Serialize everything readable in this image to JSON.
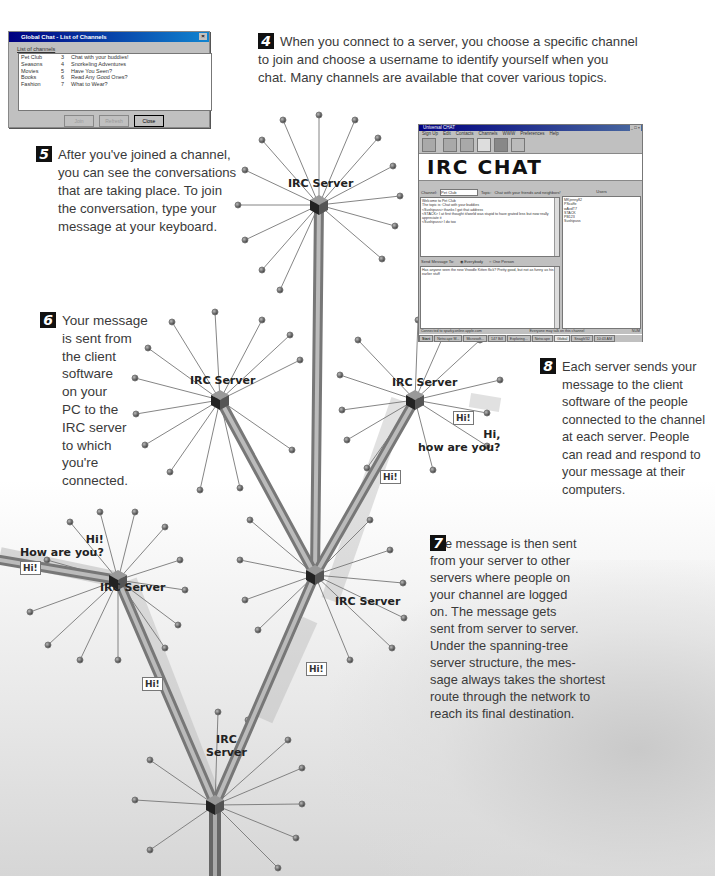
{
  "steps": [
    {
      "number": "4",
      "text": "When you connect to a server, you choose a specific channel\nto join and choose a username to identify yourself when you\nchat. Many channels are available that cover various topics."
    },
    {
      "number": "5",
      "text": "After you've joined a channel,\nyou can see the conversations\nthat are taking place. To join\nthe conversation, type your\nmessage at your keyboard."
    },
    {
      "number": "6",
      "text": "Your message\nis sent from\nthe client\nsoftware\non your\nPC to the\nIRC server\nto which\nyou're\nconnected."
    },
    {
      "number": "7",
      "text": "The message is then sent\nfrom your server to other\nservers where people on\nyour channel are logged\non. The message gets\nsent from server to server.\nUnder the spanning-tree\nserver structure, the mes-\nsage always takes the shortest\nroute through the network to\nreach its final destination."
    },
    {
      "number": "8",
      "text": "Each server sends your\nmessage to the client\nsoftware of the people\nconnected to the channel\nat each server. People\ncan read and respond to\nyour message at their\ncomputers."
    }
  ],
  "servers": [
    {
      "label": "IRC Server"
    },
    {
      "label": "IRC Server"
    },
    {
      "label": "IRC Server"
    },
    {
      "label": "IRC Server"
    },
    {
      "label": "IRC Server"
    },
    {
      "label": "IRC\nServer"
    }
  ],
  "messages": {
    "hi_box": "Hi!",
    "reply_right": "Hi,\nhow are you?",
    "reply_left": "Hi!\nHow are you?"
  },
  "channel_dialog": {
    "title": "Global Chat - List of Channels",
    "list_label": "List of channels",
    "channels": [
      {
        "name": "Pet Club",
        "count": "3",
        "topic": "Chat with your buddies!"
      },
      {
        "name": "Seasons",
        "count": "4",
        "topic": "Snorkeling Adventures"
      },
      {
        "name": "Movies",
        "count": "5",
        "topic": "Have You Seen?"
      },
      {
        "name": "Books",
        "count": "6",
        "topic": "Read Any Good Ones?"
      },
      {
        "name": "Fashion",
        "count": "7",
        "topic": "What to Wear?"
      }
    ],
    "buttons": {
      "join": "Join",
      "refresh": "Refresh",
      "close": "Close"
    }
  },
  "chat_window": {
    "title": "Universal CHAT",
    "menu": [
      "Sign Up",
      "Edit",
      "Contacts",
      "Channels",
      "WWW",
      "Preferences",
      "Help"
    ],
    "banner": "IRC CHAT",
    "channel_label": "Channel:",
    "channel_value": "Pet Club",
    "topic_label": "Topic:",
    "topic_value": "Chat with your friends and neighbors!",
    "users_header": "Users",
    "conversation": [
      "Welcome to Pet Club",
      "The topic is: Chat with your buddies",
      "<Sushipuss> thanks I got that address",
      "<STACK> I at first thought it/world was stupid to have grated less but now really appreciate it",
      "<Sushipuss> I do too"
    ],
    "users": [
      "MKjenny82",
      "PScaffe",
      "wAvdT7",
      "STACK",
      "PB123",
      "Sushipuss"
    ],
    "send_label": "Send Message To:",
    "send_everybody": "Everybody",
    "send_one": "One Person",
    "message_text": "Has anyone seen the new Vroodle Kitten flick? Pretty good, but not as funny as his earlier stuff",
    "status_left": "Connected to sparky.online.apple.com",
    "status_mid": "Everyone may talk on this channel",
    "status_right": "NUM",
    "taskbar": [
      "Start",
      "Netscape M...",
      "Microsoft...",
      "147 Bill",
      "Exploring...",
      "Netscape",
      "Global",
      "SnagIt/32",
      "10:43 AM"
    ]
  }
}
